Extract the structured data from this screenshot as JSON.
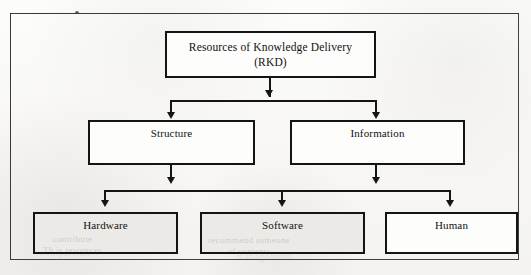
{
  "figure": {
    "type": "hierarchy-tree",
    "levels": 3,
    "root": {
      "id": "rkd",
      "label": "Resources of Knowledge Delivery\n(RKD)",
      "line1": "Resources of Knowledge Delivery",
      "line2": "(RKD)",
      "shaded": false
    },
    "level2": [
      {
        "id": "structure",
        "label": "Structure",
        "shaded": false
      },
      {
        "id": "information",
        "label": "Information",
        "shaded": false
      }
    ],
    "level3": [
      {
        "id": "hardware",
        "label": "Hardware",
        "shaded": true
      },
      {
        "id": "software",
        "label": "Software",
        "shaded": true
      },
      {
        "id": "human",
        "label": "Human",
        "shaded": false
      }
    ],
    "edges": [
      {
        "from": "rkd",
        "to": "structure"
      },
      {
        "from": "rkd",
        "to": "information"
      },
      {
        "from": "structure",
        "to": "hardware"
      },
      {
        "from": "structure",
        "to": "software"
      },
      {
        "from": "structure",
        "to": "human"
      },
      {
        "from": "information",
        "to": "hardware"
      },
      {
        "from": "information",
        "to": "software"
      },
      {
        "from": "information",
        "to": "human"
      }
    ]
  },
  "colors": {
    "ink": "#141414",
    "frame": "#3a3a3a",
    "box_fill": "#fdfdfc",
    "box_fill_shaded": "#eceae7",
    "paper": "#f8f7f5"
  },
  "artifacts": {
    "ghost_hardware": "contribute\nTh is resources",
    "ghost_software": "recommend someone\nof contents",
    "ghost_page_left": "a relatively\ncomparison",
    "ghost_page_right": "with the\nmanagement"
  }
}
